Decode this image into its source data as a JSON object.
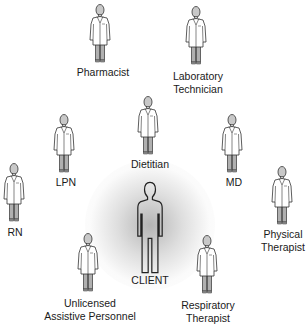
{
  "diagram": {
    "center": {
      "label": "CLIENT",
      "icon": "client-person-icon"
    },
    "members": [
      {
        "id": "pharmacist",
        "label_lines": [
          "Pharmacist"
        ],
        "icon": "healthcare-worker-icon"
      },
      {
        "id": "laboratory-technician",
        "label_lines": [
          "Laboratory",
          "Technician"
        ],
        "icon": "healthcare-worker-icon"
      },
      {
        "id": "lpn",
        "label_lines": [
          "LPN"
        ],
        "icon": "healthcare-worker-icon"
      },
      {
        "id": "dietitian",
        "label_lines": [
          "Dietitian"
        ],
        "icon": "healthcare-worker-icon"
      },
      {
        "id": "md",
        "label_lines": [
          "MD"
        ],
        "icon": "healthcare-worker-icon"
      },
      {
        "id": "rn",
        "label_lines": [
          "RN"
        ],
        "icon": "healthcare-worker-icon"
      },
      {
        "id": "physical-therapist",
        "label_lines": [
          "Physical",
          "Therapist"
        ],
        "icon": "healthcare-worker-icon"
      },
      {
        "id": "unlicensed-assistive-personnel",
        "label_lines": [
          "Unlicensed",
          "Assistive Personnel"
        ],
        "icon": "healthcare-worker-icon"
      },
      {
        "id": "respiratory-therapist",
        "label_lines": [
          "Respiratory",
          "Therapist"
        ],
        "icon": "healthcare-worker-icon"
      }
    ],
    "colors": {
      "outline": "#333333",
      "coat": "#ffffff",
      "pants": "#b0b0b0",
      "head": "#c8c8c8",
      "glow": "#9a9a9a"
    }
  }
}
